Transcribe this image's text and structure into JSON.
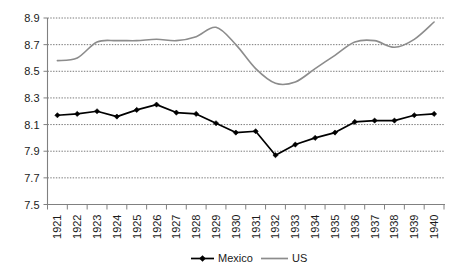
{
  "chart_data": {
    "type": "line",
    "title": "",
    "xlabel": "",
    "ylabel": "",
    "ylim": [
      7.5,
      8.9
    ],
    "yticks": [
      7.5,
      7.7,
      7.9,
      8.1,
      8.3,
      8.5,
      8.7,
      8.9
    ],
    "ytick_labels": [
      "7.5",
      "7.7",
      "7.9",
      "8.1",
      "8.3",
      "8.5",
      "8.7",
      "8.9"
    ],
    "grid": true,
    "grid_axis": "y",
    "legend_position": "bottom",
    "categories": [
      1921,
      1922,
      1923,
      1924,
      1925,
      1926,
      1927,
      1928,
      1929,
      1930,
      1931,
      1932,
      1933,
      1934,
      1935,
      1936,
      1937,
      1938,
      1939,
      1940
    ],
    "xtick_labels": [
      "1921",
      "1922",
      "1923",
      "1924",
      "1925",
      "1926",
      "1927",
      "1928",
      "1929",
      "1930",
      "1931",
      "1932",
      "1933",
      "1934",
      "1935",
      "1936",
      "1937",
      "1938",
      "1939",
      "1940"
    ],
    "series": [
      {
        "name": "Mexico",
        "color": "#000000",
        "marker": "diamond",
        "values": [
          8.17,
          8.18,
          8.2,
          8.16,
          8.21,
          8.25,
          8.19,
          8.18,
          8.11,
          8.04,
          8.05,
          7.87,
          7.95,
          8.0,
          8.04,
          8.12,
          8.13,
          8.13,
          8.17,
          8.18
        ]
      },
      {
        "name": "US",
        "color": "#8c8c8c",
        "marker": "none",
        "values": [
          8.58,
          8.6,
          8.72,
          8.73,
          8.73,
          8.74,
          8.73,
          8.76,
          8.83,
          8.7,
          8.52,
          8.41,
          8.42,
          8.52,
          8.62,
          8.72,
          8.73,
          8.68,
          8.74,
          8.87
        ]
      }
    ]
  },
  "legend": {
    "items": [
      {
        "label": "Mexico"
      },
      {
        "label": "US"
      }
    ]
  }
}
